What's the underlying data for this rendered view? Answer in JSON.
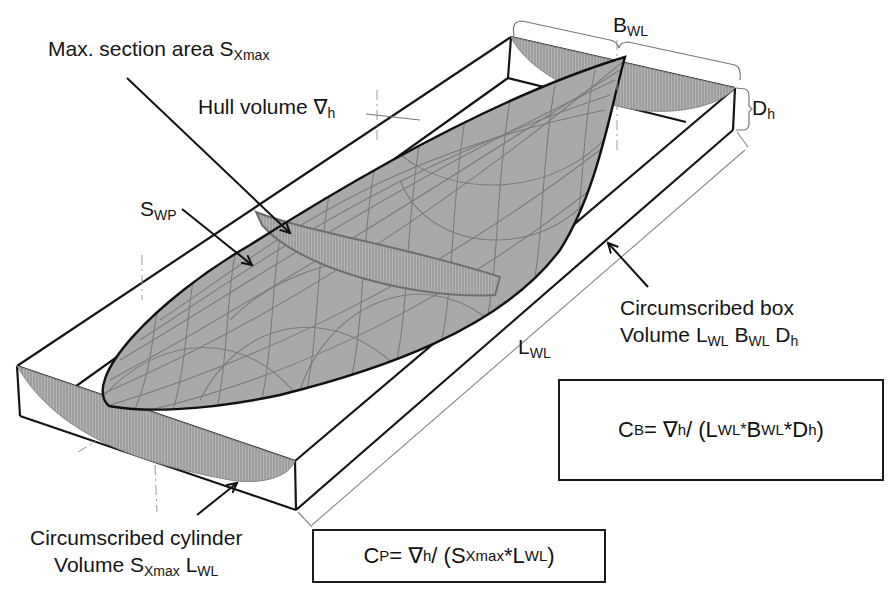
{
  "figure": {
    "colors": {
      "hull_fill": "#a9a9a9",
      "hull_grid": "#7a7a7a",
      "section_hatch": "#8c8c8c",
      "outline": "#111111",
      "dim_line": "#777777",
      "background": "#ffffff"
    }
  },
  "labels": {
    "max_section": {
      "text": "Max. section area S",
      "sub": "Xmax"
    },
    "hull_volume": {
      "text": "Hull volume ∇",
      "sub": "h"
    },
    "swp": {
      "text": "S",
      "sub": "WP"
    },
    "bwl": {
      "text": "B",
      "sub": "WL"
    },
    "dh": {
      "text": "D",
      "sub": "h"
    },
    "lwl": {
      "text": "L",
      "sub": "WL"
    },
    "box": {
      "line1": "Circumscribed box",
      "line2_prefix": "Volume ",
      "l": "L",
      "l_sub": "WL",
      "b": "B",
      "b_sub": "WL",
      "d": "D",
      "d_sub": "h"
    },
    "cylinder": {
      "line1": "Circumscribed cylinder",
      "line2_prefix": "Volume ",
      "s": "S",
      "s_sub": "Xmax",
      "l": "L",
      "l_sub": "WL"
    }
  },
  "formulas": {
    "cb": {
      "lhs": "C",
      "lhs_sub": "B",
      "eq": " = ∇",
      "nabla_sub": "h",
      "div": " / (L",
      "l_sub": "WL",
      "star1": "*",
      "b": " B",
      "b_sub": "WL",
      "star2": "*D",
      "d_sub": "h",
      "close": ")"
    },
    "cp": {
      "lhs": "C",
      "lhs_sub": "P",
      "eq": " = ∇",
      "nabla_sub": "h",
      "div": " / (S",
      "s_sub": "Xmax",
      "star": "*L",
      "l_sub": "WL",
      "close": ")"
    }
  }
}
